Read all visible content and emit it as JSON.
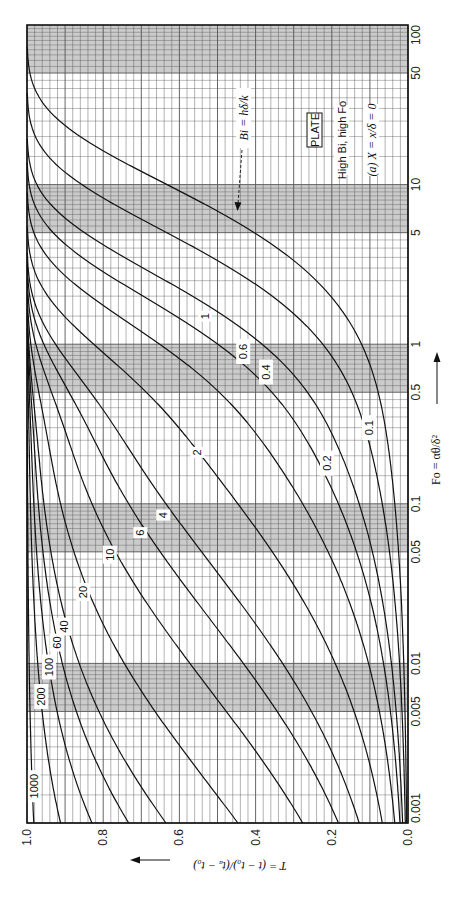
{
  "chart_data": {
    "type": "line",
    "title": "PLATE",
    "subtitle": "High Bi, high Fo",
    "panel_label": "(a) X = x/δ = 0",
    "xlabel": "Fo = αθ/δ²",
    "ylabel": "T = (t − t₀)/(tₐ − t₀)",
    "x_scale": "log",
    "xlim": [
      0.001,
      100
    ],
    "ylim": [
      0.0,
      1.0
    ],
    "x_ticks": [
      "0.001",
      "0.005",
      "0.01",
      "0.05",
      "0.1",
      "0.5",
      "1",
      "5",
      "10",
      "50",
      "100"
    ],
    "x_tick_values": [
      0.001,
      0.005,
      0.01,
      0.05,
      0.1,
      0.5,
      1,
      5,
      10,
      50,
      100
    ],
    "y_ticks": [
      "0.0",
      "0.2",
      "0.4",
      "0.6",
      "0.8",
      "1.0"
    ],
    "y_tick_values": [
      0.0,
      0.2,
      0.4,
      0.6,
      0.8,
      1.0
    ],
    "orientation": "rotated 90° (Fo axis vertical on right, T axis horizontal on bottom, T decreasing to the right)",
    "grid": true,
    "legend": "inline curve labels",
    "parameter_name": "Bi = hδ/k",
    "series": [
      {
        "name": "0.1",
        "Bi": 0.1
      },
      {
        "name": "0.2",
        "Bi": 0.2
      },
      {
        "name": "0.4",
        "Bi": 0.4
      },
      {
        "name": "0.6",
        "Bi": 0.6
      },
      {
        "name": "1",
        "Bi": 1
      },
      {
        "name": "2",
        "Bi": 2
      },
      {
        "name": "4",
        "Bi": 4
      },
      {
        "name": "6",
        "Bi": 6
      },
      {
        "name": "10",
        "Bi": 10
      },
      {
        "name": "20",
        "Bi": 20
      },
      {
        "name": "40",
        "Bi": 40
      },
      {
        "name": "60",
        "Bi": 60
      },
      {
        "name": "100",
        "Bi": 100
      },
      {
        "name": "200",
        "Bi": 200
      },
      {
        "name": "1000",
        "Bi": 1000
      }
    ],
    "sample_points": {
      "Bi_0.1": {
        "Fo": [
          0.1,
          1,
          10,
          50
        ],
        "T": [
          0.04,
          0.12,
          0.63,
          0.99
        ]
      },
      "Bi_1": {
        "Fo": [
          0.01,
          0.1,
          1,
          5
        ],
        "T": [
          0.1,
          0.27,
          0.62,
          0.97
        ]
      },
      "Bi_10": {
        "Fo": [
          0.001,
          0.01,
          0.1,
          1
        ],
        "T": [
          0.27,
          0.56,
          0.83,
          0.99
        ]
      },
      "Bi_100": {
        "Fo": [
          0.001,
          0.01,
          0.1
        ],
        "T": [
          0.83,
          0.94,
          0.98
        ]
      },
      "Bi_1000": {
        "Fo": [
          0.001,
          0.01
        ],
        "T": [
          0.98,
          0.99
        ]
      }
    },
    "label_positions": {
      "0.1": [
        0.1,
        0.3
      ],
      "0.2": [
        0.21,
        0.18
      ],
      "0.4": [
        0.37,
        0.67
      ],
      "0.6": [
        0.43,
        0.9
      ],
      "1": [
        0.53,
        1.5
      ],
      "2": [
        0.55,
        0.21
      ],
      "4": [
        0.64,
        0.085
      ],
      "6": [
        0.7,
        0.066
      ],
      "10": [
        0.78,
        0.048
      ],
      "20": [
        0.85,
        0.028
      ],
      "40": [
        0.9,
        0.017
      ],
      "60": [
        0.92,
        0.0135
      ],
      "100": [
        0.94,
        0.0095
      ],
      "200": [
        0.96,
        0.0062
      ],
      "1000": [
        0.98,
        0.0017
      ]
    },
    "arrow_label": "Bi = hδ/k",
    "colors": {
      "curve": "#111111",
      "grid": "#555555",
      "band": "#b9b9b9"
    }
  }
}
